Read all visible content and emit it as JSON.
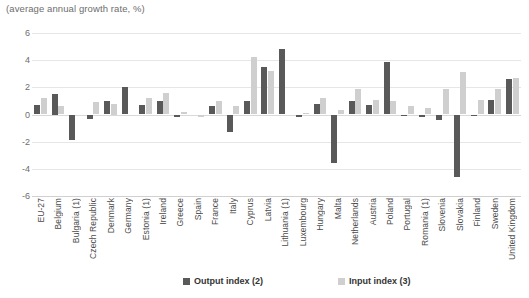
{
  "chart_data": {
    "type": "bar",
    "title": "",
    "subtitle": "(average annual growth rate, %)",
    "xlabel": "",
    "ylabel": "",
    "ylim": [
      -6,
      6
    ],
    "yticks": [
      6,
      4,
      2,
      0,
      -2,
      -4,
      -6
    ],
    "grid": true,
    "legend_position": "bottom",
    "categories": [
      "EU-27",
      "Belgium",
      "Bulgaria (1)",
      "Czech Republic",
      "Denmark",
      "Germany",
      "Estonia (1)",
      "Ireland",
      "Greece",
      "Spain",
      "France",
      "Italy",
      "Cyprus",
      "Latvia",
      "Lithuania (1)",
      "Luxembourg",
      "Hungary",
      "Malta",
      "Netherlands",
      "Austria",
      "Poland",
      "Portugal",
      "Romania (1)",
      "Slovenia",
      "Slovakia",
      "Finland",
      "Sweden",
      "United Kingdom"
    ],
    "series": [
      {
        "name": "Output index (2)",
        "color": "#595959",
        "values": [
          0.7,
          1.5,
          -1.9,
          -0.35,
          1.0,
          2.0,
          0.7,
          1.0,
          -0.15,
          0.0,
          0.6,
          -1.3,
          1.0,
          3.5,
          4.8,
          -0.15,
          0.8,
          -3.6,
          1.0,
          0.7,
          3.9,
          -0.1,
          -0.2,
          -0.4,
          -4.6,
          -0.1,
          1.1,
          2.6
        ]
      },
      {
        "name": "Input index (3)",
        "color": "#cfcfcf",
        "values": [
          1.2,
          0.6,
          0.0,
          0.9,
          0.75,
          0.0,
          1.2,
          1.6,
          0.15,
          -0.15,
          1.0,
          0.6,
          4.2,
          3.2,
          0.0,
          0.1,
          1.2,
          0.3,
          1.9,
          1.1,
          1.0,
          0.6,
          0.45,
          1.9,
          3.1,
          1.1,
          1.9,
          2.7
        ]
      }
    ]
  },
  "legend": {
    "output_label": "Output index (2)",
    "input_label": "Input index (3)"
  }
}
